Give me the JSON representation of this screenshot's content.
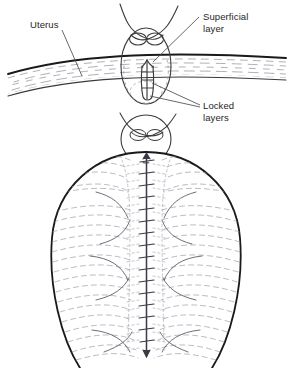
{
  "figure": {
    "background_color": "#ffffff",
    "ink_color": "#1a1a1a",
    "fiber_color": "#8c8c9a",
    "text_color": "#262626",
    "leader_color": "#4d4d4d"
  },
  "labels": [
    {
      "id": "uterus",
      "name": "label-uterus",
      "lines": [
        "Uterus"
      ],
      "text": "Uterus"
    },
    {
      "id": "superficial-layer",
      "name": "label-superficial-layer",
      "lines": [
        "Superficial",
        "layer"
      ],
      "text": "Superficial\nlayer"
    },
    {
      "id": "locked-layers",
      "name": "label-locked-layers",
      "lines": [
        "Locked",
        "layers"
      ],
      "text": "Locked\nlayers"
    }
  ],
  "panels": {
    "upper": {
      "name": "sagittal-section-panel",
      "description": "Uterine wall band in cross section with fetal head presenting at the cervix"
    },
    "lower": {
      "name": "anterior-view-panel",
      "description": "Uterus seen from the front with fetal head at the fundus and sagittal suture down the midline"
    }
  }
}
